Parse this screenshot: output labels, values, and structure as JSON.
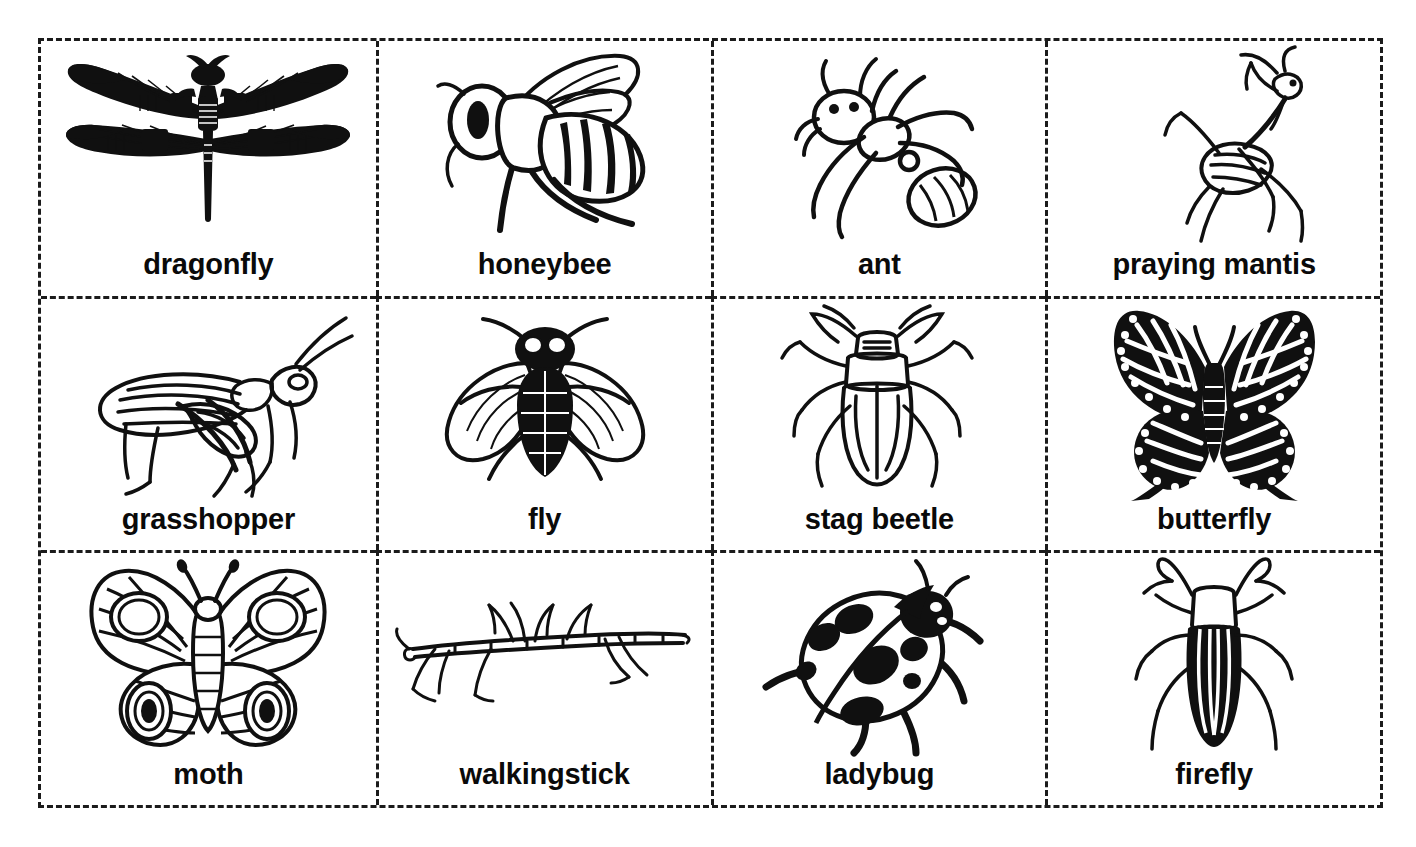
{
  "header": {
    "title_cropped": "More Insects: Match the Picture to the Word"
  },
  "grid": {
    "rows": 3,
    "columns": 4,
    "border_style": "dashed",
    "border_color": "#1b1b1b",
    "background": "#ffffff",
    "ink_color": "#101010"
  },
  "cells": [
    {
      "label": "dragonfly",
      "icon": "dragonfly-illustration",
      "row": 1,
      "col": 1
    },
    {
      "label": "honeybee",
      "icon": "honeybee-illustration",
      "row": 1,
      "col": 2
    },
    {
      "label": "ant",
      "icon": "ant-illustration",
      "row": 1,
      "col": 3
    },
    {
      "label": "praying mantis",
      "icon": "praying-mantis-illustration",
      "row": 1,
      "col": 4
    },
    {
      "label": "grasshopper",
      "icon": "grasshopper-illustration",
      "row": 2,
      "col": 1
    },
    {
      "label": "fly",
      "icon": "fly-illustration",
      "row": 2,
      "col": 2
    },
    {
      "label": "stag beetle",
      "icon": "stag-beetle-illustration",
      "row": 2,
      "col": 3
    },
    {
      "label": "butterfly",
      "icon": "butterfly-illustration",
      "row": 2,
      "col": 4
    },
    {
      "label": "moth",
      "icon": "moth-illustration",
      "row": 3,
      "col": 1
    },
    {
      "label": "walkingstick",
      "icon": "walkingstick-illustration",
      "row": 3,
      "col": 2
    },
    {
      "label": "ladybug",
      "icon": "ladybug-illustration",
      "row": 3,
      "col": 3
    },
    {
      "label": "firefly",
      "icon": "firefly-illustration",
      "row": 3,
      "col": 4
    }
  ]
}
